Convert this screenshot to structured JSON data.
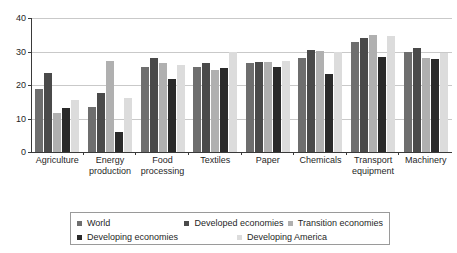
{
  "chart_data": {
    "type": "bar",
    "title": "",
    "subtitle": "",
    "xlabel": "",
    "ylabel": "",
    "ylim": [
      0,
      40
    ],
    "yticks": [
      0,
      10,
      20,
      30,
      40
    ],
    "grid": true,
    "legend_position": "bottom",
    "categories": [
      "Agriculture",
      "Energy production",
      "Food processing",
      "Textiles",
      "Paper",
      "Chemicals",
      "Transport equipment",
      "Machinery"
    ],
    "series": [
      {
        "name": "World",
        "color": "#6e6e6e",
        "values": [
          18.7,
          13.3,
          25.3,
          25.5,
          26.7,
          28.2,
          32.8,
          29.8
        ]
      },
      {
        "name": "Developed economies",
        "color": "#4a4a4a",
        "values": [
          23.5,
          17.5,
          28.0,
          26.7,
          27.0,
          30.6,
          34.0,
          31.0
        ]
      },
      {
        "name": "Transition economies",
        "color": "#b0b0b0",
        "values": [
          11.7,
          27.3,
          26.6,
          24.6,
          26.8,
          30.3,
          35.0,
          28.0
        ]
      },
      {
        "name": "Developing economies",
        "color": "#2a2a2a",
        "values": [
          13.2,
          6.0,
          21.8,
          25.0,
          25.5,
          23.4,
          28.5,
          27.8
        ]
      },
      {
        "name": "Developing America",
        "color": "#dcdcdc",
        "values": [
          15.5,
          16.0,
          26.0,
          30.0,
          27.3,
          30.0,
          34.7,
          29.6
        ]
      }
    ]
  },
  "axis": {
    "y_tick_40": "40",
    "y_tick_30": "30",
    "y_tick_20": "20",
    "y_tick_10": "10",
    "y_tick_0": "0"
  },
  "xaxis": {
    "labels": [
      {
        "line1": "Agriculture",
        "line2": ""
      },
      {
        "line1": "Energy",
        "line2": "production"
      },
      {
        "line1": "Food",
        "line2": "processing"
      },
      {
        "line1": "Textiles",
        "line2": ""
      },
      {
        "line1": "Paper",
        "line2": ""
      },
      {
        "line1": "Chemicals",
        "line2": ""
      },
      {
        "line1": "Transport",
        "line2": "equipment"
      },
      {
        "line1": "Machinery",
        "line2": ""
      }
    ]
  },
  "legend": {
    "items": [
      {
        "label": "World",
        "color": "#6e6e6e"
      },
      {
        "label": "Developed economies",
        "color": "#4a4a4a"
      },
      {
        "label": "Transition economies",
        "color": "#b0b0b0"
      },
      {
        "label": "Developing economies",
        "color": "#2a2a2a"
      },
      {
        "label": "Developing America",
        "color": "#dcdcdc"
      }
    ]
  }
}
